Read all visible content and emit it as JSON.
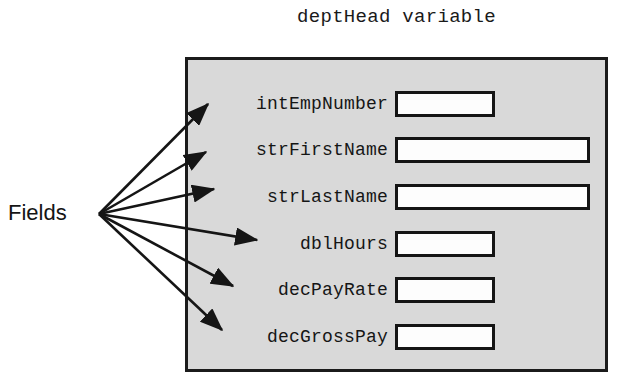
{
  "diagram": {
    "title": "deptHead variable",
    "caption": "Fields",
    "box_fill_color": "#d9d9d9",
    "box_border_color": "#1b1b1b",
    "value_box_fill_color": "#fdfdfd",
    "value_box_border_color": "#151515",
    "arrow_color": "#151515"
  },
  "fields": [
    {
      "name": "intEmpNumber",
      "value": "",
      "row_top": 30,
      "box_width": 100
    },
    {
      "name": "strFirstName",
      "value": "",
      "row_top": 76,
      "box_width": 195
    },
    {
      "name": "strLastName",
      "value": "",
      "row_top": 123,
      "box_width": 195
    },
    {
      "name": "dblHours",
      "value": "",
      "row_top": 170,
      "box_width": 100
    },
    {
      "name": "decPayRate",
      "value": "",
      "row_top": 216,
      "box_width": 100
    },
    {
      "name": "decGrossPay",
      "value": "",
      "row_top": 263,
      "box_width": 100
    }
  ],
  "arrows": {
    "origin": {
      "x": 99,
      "y": 214
    },
    "targets": [
      {
        "field": "intEmpNumber",
        "x": 208,
        "y": 104
      },
      {
        "field": "strFirstName",
        "x": 206,
        "y": 152
      },
      {
        "field": "strLastName",
        "x": 214,
        "y": 189
      },
      {
        "field": "dblHours",
        "x": 257,
        "y": 240
      },
      {
        "field": "decPayRate",
        "x": 233,
        "y": 286
      },
      {
        "field": "decGrossPay",
        "x": 222,
        "y": 330
      }
    ]
  }
}
